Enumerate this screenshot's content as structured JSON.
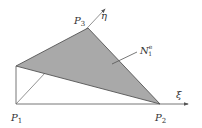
{
  "diagram": {
    "type": "finite-element-shape-function",
    "points": {
      "P1": {
        "label": "P",
        "sub": "1"
      },
      "P2": {
        "label": "P",
        "sub": "2"
      },
      "P3": {
        "label": "P",
        "sub": "3"
      }
    },
    "axes": {
      "xi": {
        "label": "ξ"
      },
      "eta": {
        "label": "η"
      }
    },
    "surface_label": {
      "label": "N",
      "sub": "1",
      "sup": "e"
    },
    "colors": {
      "fill": "#a9a9a9",
      "line": "#555555",
      "text": "#333333"
    }
  }
}
